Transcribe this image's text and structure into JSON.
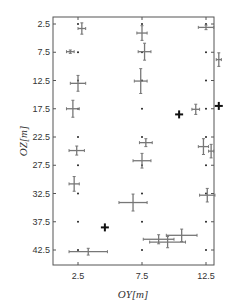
{
  "chart_data": {
    "type": "scatter",
    "title": "",
    "xlabel": "OY[m]",
    "ylabel": "OZ[m]",
    "xlim": [
      0.5,
      15.0
    ],
    "ylim": [
      46.5,
      1.3
    ],
    "y_inverted": true,
    "grid": false,
    "x_ticks": [
      2.5,
      7.5,
      12.5
    ],
    "x_tick_labels": [
      "2.5",
      "7.5",
      "12.5"
    ],
    "y_ticks": [
      2.5,
      7.5,
      12.5,
      17.5,
      22.5,
      27.5,
      32.5,
      37.5,
      42.5
    ],
    "y_tick_labels": [
      "2.5",
      "7.5",
      "12.5",
      "17.5",
      "22.5",
      "27.5",
      "32.5",
      "37.5",
      "42.5"
    ],
    "colors": {
      "grid_dot": "#222222",
      "estimate": "#777777",
      "source": "#111111",
      "axis": "#555555"
    },
    "series": [
      {
        "name": "grid points",
        "marker": "dot",
        "points": [
          [
            2.5,
            2.5
          ],
          [
            2.5,
            7.5
          ],
          [
            2.5,
            12.5
          ],
          [
            2.5,
            17.5
          ],
          [
            2.5,
            22.5
          ],
          [
            2.5,
            27.5
          ],
          [
            2.5,
            32.5
          ],
          [
            2.5,
            37.5
          ],
          [
            2.5,
            42.5
          ],
          [
            7.5,
            2.5
          ],
          [
            7.5,
            7.5
          ],
          [
            7.5,
            12.5
          ],
          [
            7.5,
            17.5
          ],
          [
            7.5,
            22.5
          ],
          [
            7.5,
            27.5
          ],
          [
            7.5,
            32.5
          ],
          [
            7.5,
            37.5
          ],
          [
            7.5,
            42.5
          ],
          [
            12.5,
            2.5
          ],
          [
            12.5,
            7.5
          ],
          [
            12.5,
            12.5
          ],
          [
            12.5,
            17.5
          ],
          [
            12.5,
            22.5
          ],
          [
            12.5,
            27.5
          ],
          [
            12.5,
            32.5
          ],
          [
            12.5,
            37.5
          ],
          [
            12.5,
            42.5
          ]
        ]
      },
      {
        "name": "estimates with error bars",
        "marker": "errorbar-cross",
        "points": [
          {
            "x": 2.8,
            "y": 3.3,
            "xerr": 0.3,
            "yerr": 1.0
          },
          {
            "x": 1.9,
            "y": 7.4,
            "xerr": 0.3,
            "yerr": 0.3
          },
          {
            "x": 2.5,
            "y": 13.0,
            "xerr": 0.6,
            "yerr": 1.4
          },
          {
            "x": 2.1,
            "y": 17.5,
            "xerr": 0.5,
            "yerr": 1.5
          },
          {
            "x": 2.4,
            "y": 24.9,
            "xerr": 0.6,
            "yerr": 0.8
          },
          {
            "x": 2.2,
            "y": 30.8,
            "xerr": 0.4,
            "yerr": 1.3
          },
          {
            "x": 3.3,
            "y": 42.8,
            "xerr": 1.5,
            "yerr": 0.6
          },
          {
            "x": 7.5,
            "y": 4.1,
            "xerr": 0.4,
            "yerr": 1.3
          },
          {
            "x": 7.7,
            "y": 7.4,
            "xerr": 0.5,
            "yerr": 1.5
          },
          {
            "x": 7.4,
            "y": 12.6,
            "xerr": 0.5,
            "yerr": 2.2
          },
          {
            "x": 7.8,
            "y": 23.5,
            "xerr": 0.5,
            "yerr": 0.7
          },
          {
            "x": 7.5,
            "y": 26.7,
            "xerr": 0.7,
            "yerr": 1.3
          },
          {
            "x": 6.8,
            "y": 34.1,
            "xerr": 1.1,
            "yerr": 1.5
          },
          {
            "x": 8.8,
            "y": 40.6,
            "xerr": 1.2,
            "yerr": 0.8
          },
          {
            "x": 9.5,
            "y": 41.1,
            "xerr": 1.4,
            "yerr": 1.0
          },
          {
            "x": 10.6,
            "y": 39.9,
            "xerr": 1.2,
            "yerr": 1.1
          },
          {
            "x": 12.5,
            "y": 3.1,
            "xerr": 0.6,
            "yerr": 0.4
          },
          {
            "x": 13.5,
            "y": 8.8,
            "xerr": 0.2,
            "yerr": 1.2
          },
          {
            "x": 11.7,
            "y": 17.6,
            "xerr": 0.3,
            "yerr": 0.9
          },
          {
            "x": 12.3,
            "y": 24.2,
            "xerr": 0.4,
            "yerr": 1.4
          },
          {
            "x": 12.9,
            "y": 25.0,
            "xerr": 0.2,
            "yerr": 1.2
          },
          {
            "x": 12.6,
            "y": 32.8,
            "xerr": 0.6,
            "yerr": 1.2
          }
        ]
      },
      {
        "name": "sources",
        "marker": "plus-bold",
        "points": [
          [
            10.4,
            18.5
          ],
          [
            13.5,
            17.0
          ],
          [
            4.6,
            38.5
          ]
        ]
      }
    ]
  }
}
